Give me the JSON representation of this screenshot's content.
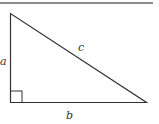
{
  "diagram": {
    "type": "right-triangle",
    "labels": {
      "side_a": "a",
      "side_b": "b",
      "side_c": "c"
    },
    "colors": {
      "stroke": "#333333",
      "rule": "#666666"
    }
  }
}
